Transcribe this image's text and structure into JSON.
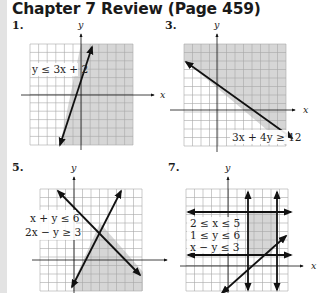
{
  "page": {
    "title": "Chapter 7 Review (Page 459)",
    "colors": {
      "shade": "#d6d6d6",
      "grid": "#a8a8a8",
      "line": "#111111",
      "margin": "#e3e3e3"
    }
  },
  "problems": [
    {
      "number": "1.",
      "inequalities": [
        "y ≤ 3x + 2"
      ],
      "x_label": "x",
      "y_label": "y"
    },
    {
      "number": "3.",
      "inequalities": [
        "3x + 4y ≥ 12"
      ],
      "x_label": "x",
      "y_label": "y"
    },
    {
      "number": "5.",
      "inequalities": [
        "x + y ≤ 6",
        "2x − y ≥ 3"
      ],
      "x_label": "x",
      "y_label": "y"
    },
    {
      "number": "7.",
      "inequalities": [
        "2 ≤ x ≤ 5",
        "1 ≤ y ≤ 6",
        "x − y ≤ 3"
      ],
      "x_label": "x",
      "y_label": "y"
    }
  ]
}
